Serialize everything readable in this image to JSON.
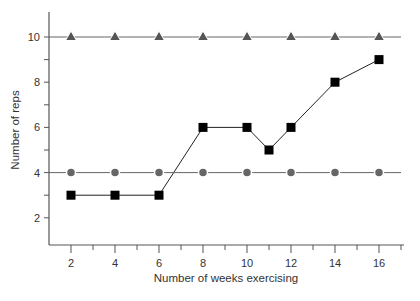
{
  "chart_data": {
    "type": "line",
    "title": "",
    "xlabel": "Number of weeks exercising",
    "ylabel": "Number of reps",
    "x": [
      2,
      4,
      6,
      8,
      10,
      11,
      12,
      14,
      16
    ],
    "xticks": [
      2,
      4,
      6,
      8,
      10,
      12,
      14,
      16
    ],
    "yticks": [
      2,
      4,
      6,
      8,
      10
    ],
    "xlim": [
      1,
      17
    ],
    "ylim": [
      0.8,
      11
    ],
    "grid": false,
    "legend": null,
    "series": [
      {
        "name": "triangles",
        "marker": "triangle",
        "color": "#555555",
        "x": [
          2,
          4,
          6,
          8,
          10,
          12,
          14,
          16
        ],
        "values": [
          10,
          10,
          10,
          10,
          10,
          10,
          10,
          10
        ]
      },
      {
        "name": "squares",
        "marker": "square",
        "color": "#000000",
        "x": [
          2,
          4,
          6,
          8,
          10,
          11,
          12,
          14,
          16
        ],
        "values": [
          3,
          3,
          3,
          6,
          6,
          5,
          6,
          8,
          9
        ]
      },
      {
        "name": "circles",
        "marker": "circle",
        "color": "#666666",
        "x": [
          2,
          4,
          6,
          8,
          10,
          12,
          14,
          16
        ],
        "values": [
          4,
          4,
          4,
          4,
          4,
          4,
          4,
          4
        ]
      }
    ]
  }
}
